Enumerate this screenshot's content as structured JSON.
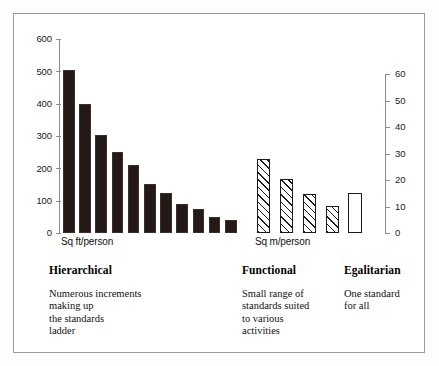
{
  "figure": {
    "frame": true,
    "background": "#ffffff"
  },
  "axes": {
    "left": {
      "unit_label": "Sq ft/person",
      "ticks": [
        "600",
        "500",
        "400",
        "300",
        "200",
        "100",
        "0"
      ],
      "min": 0,
      "max": 600
    },
    "right": {
      "unit_label": "Sq m/person",
      "ticks": [
        "60",
        "50",
        "40",
        "30",
        "20",
        "10",
        "0"
      ],
      "min": 0,
      "max": 60
    }
  },
  "groups": [
    {
      "key": "hierarchical",
      "heading": "Hierarchical",
      "caption": "Numerous increments\nmaking up\nthe standards\nladder"
    },
    {
      "key": "functional",
      "heading": "Functional",
      "caption": "Small range of\nstandards suited\nto various\nactivities"
    },
    {
      "key": "egalitarian",
      "heading": "Egalitarian",
      "caption": "One standard\nfor all"
    }
  ],
  "colors": {
    "bar_solid": "#231a16",
    "bar_hatch_line": "#1a1a1a",
    "bar_open_fill": "#ffffff",
    "axis": "#8d8d8d",
    "frame": "#9a9a9a",
    "text": "#111111"
  },
  "chart_data": {
    "type": "bar",
    "title": "",
    "subtitle": "",
    "xlabel": "",
    "ylabel": "Sq ft/person",
    "ylabel_secondary": "Sq m/person",
    "ylim": [
      0,
      600
    ],
    "ylim_secondary": [
      0,
      60
    ],
    "yticks": [
      0,
      100,
      200,
      300,
      400,
      500,
      600
    ],
    "yticks_secondary": [
      0,
      10,
      20,
      30,
      40,
      50,
      60
    ],
    "grid": false,
    "legend": "none",
    "series": [
      {
        "name": "Hierarchical",
        "axis": "left",
        "unit": "Sq ft/person",
        "style": "solid-black",
        "categories": [
          "1",
          "2",
          "3",
          "4",
          "5",
          "6",
          "7",
          "8",
          "9",
          "10",
          "11"
        ],
        "values": [
          505,
          400,
          302,
          250,
          210,
          152,
          125,
          90,
          75,
          50,
          40
        ]
      },
      {
        "name": "Functional",
        "axis": "left",
        "unit": "Sq m/person",
        "style": "diagonal-hatch",
        "categories": [
          "1",
          "2",
          "3",
          "4"
        ],
        "values": [
          230,
          168,
          120,
          85
        ],
        "values_sq_m": [
          28,
          20,
          14,
          10
        ]
      },
      {
        "name": "Egalitarian",
        "axis": "right",
        "unit": "Sq m/person",
        "style": "open-outline",
        "categories": [
          "1"
        ],
        "values": [
          15
        ]
      }
    ]
  }
}
